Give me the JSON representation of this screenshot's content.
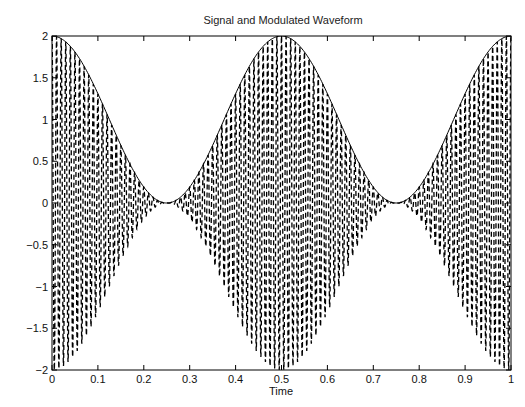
{
  "chart_data": {
    "type": "line",
    "title": "Signal and Modulated Waveform",
    "xlabel": "Time",
    "ylabel": "",
    "xlim": [
      0,
      1
    ],
    "ylim": [
      -2,
      2
    ],
    "grid": false,
    "legend": null,
    "x_ticks": [
      0,
      0.1,
      0.2,
      0.3,
      0.4,
      0.5,
      0.6,
      0.7,
      0.8,
      0.9,
      1
    ],
    "x_tick_labels": [
      "0",
      "0.1",
      "0.2",
      "0.3",
      "0.4",
      "0.5",
      "0.6",
      "0.7",
      "0.8",
      "0.9",
      "1"
    ],
    "y_ticks": [
      2,
      1.5,
      1,
      0.5,
      0,
      -0.5,
      -1,
      -1.5,
      -2
    ],
    "y_tick_labels": [
      "2",
      "1.5",
      "1",
      "0.5",
      "0",
      "-0.5",
      "-1",
      "-1.5",
      "-2"
    ],
    "series": [
      {
        "name": "Modulated waveform",
        "style": "dashed",
        "color": "#000000",
        "description": "AM waveform y = (1 + cos(2*pi*2*t)) * cos(2*pi*fc*t)",
        "envelope_frequency": 2,
        "carrier_frequency": 100,
        "samples": 4000,
        "envelope_key_points": {
          "t": [
            0,
            0.25,
            0.5,
            0.75,
            1
          ],
          "amplitude": [
            2,
            0,
            2,
            0,
            2
          ]
        }
      },
      {
        "name": "Signal envelope",
        "style": "solid",
        "color": "#000000",
        "description": "Upper envelope y = 1 + cos(2*pi*2*t)",
        "frequency": 2,
        "samples": 400
      }
    ]
  }
}
